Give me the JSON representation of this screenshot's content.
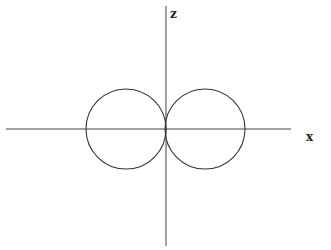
{
  "diagram": {
    "axes": {
      "vertical_label": "z",
      "horizontal_label": "x",
      "origin": [
        166,
        129
      ],
      "x_axis": {
        "x1": 6,
        "x2": 291,
        "y": 129
      },
      "z_axis": {
        "y1": 6,
        "y2": 246,
        "x": 166
      }
    },
    "lobes": [
      {
        "name": "left-lobe",
        "cx": 126,
        "cy": 129,
        "r": 40
      },
      {
        "name": "right-lobe",
        "cx": 205,
        "cy": 129,
        "r": 40
      }
    ],
    "stroke_color": "#333333"
  }
}
